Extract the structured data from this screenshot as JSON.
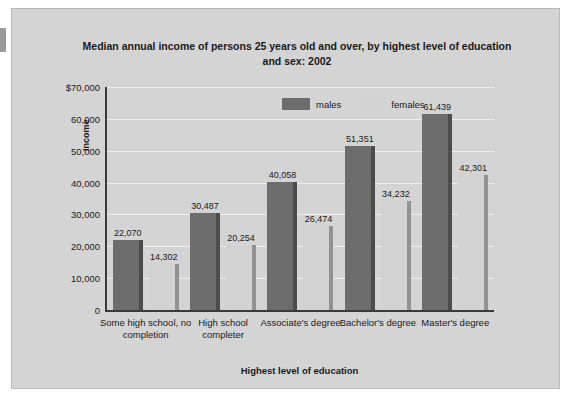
{
  "chart_data": {
    "type": "bar",
    "title": "Median annual income of persons 25 years old and over, by highest level of education and sex: 2002",
    "xlabel": "Highest level of education",
    "ylabel": "Income",
    "categories": [
      "Some high school, no completion",
      "High school completer",
      "Associate's degree",
      "Bachelor's degree",
      "Master's degree"
    ],
    "series": [
      {
        "name": "males",
        "color": "#6d6d6d",
        "values": [
          22070,
          30487,
          40058,
          51351,
          61439
        ],
        "labels": [
          "22,070",
          "30,487",
          "40,058",
          "51,351",
          "61,439"
        ]
      },
      {
        "name": "females",
        "color": "#d2d2d2",
        "values": [
          14302,
          20254,
          26474,
          34232,
          42301
        ],
        "labels": [
          "14,302",
          "20,254",
          "26,474",
          "34,232",
          "42,301"
        ]
      }
    ],
    "ylim": [
      0,
      70000
    ],
    "ytick_labels": [
      "$70,000",
      "60,000",
      "50,000",
      "40,000",
      "30,000",
      "20,000",
      "10,000",
      "0"
    ],
    "ytick_values": [
      70000,
      60000,
      50000,
      40000,
      30000,
      20000,
      10000,
      0
    ],
    "grid": true,
    "legend_position": "top-center",
    "background_color": "#d4d4d4"
  }
}
